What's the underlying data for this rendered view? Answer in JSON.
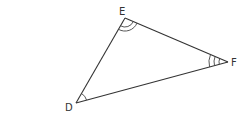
{
  "diagram": {
    "type": "triangle",
    "vertices": [
      {
        "name": "D",
        "label": "D",
        "x": 76,
        "y": 103,
        "angle_marks": 1
      },
      {
        "name": "E",
        "label": "E",
        "x": 125,
        "y": 18,
        "angle_marks": 2
      },
      {
        "name": "F",
        "label": "F",
        "x": 228,
        "y": 62,
        "angle_marks": 3
      }
    ],
    "edges": [
      [
        "D",
        "E"
      ],
      [
        "E",
        "F"
      ],
      [
        "F",
        "D"
      ]
    ],
    "colors": {
      "stroke": "#333333",
      "background": "#ffffff"
    }
  }
}
